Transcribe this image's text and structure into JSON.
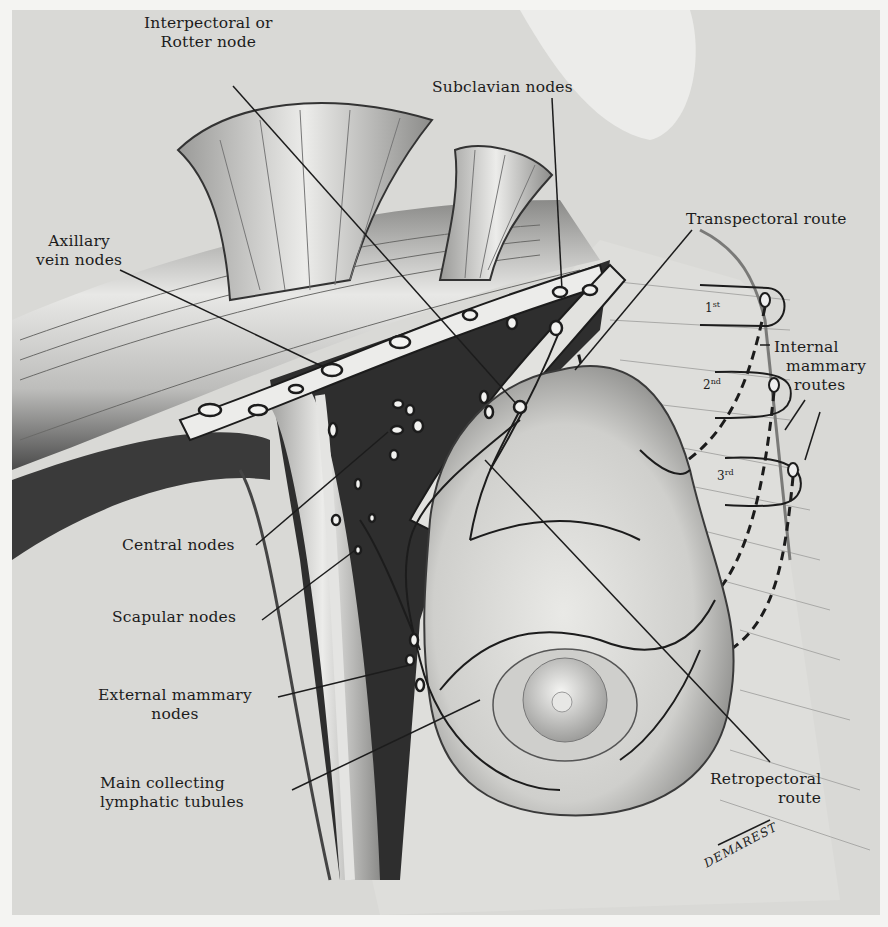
{
  "figure": {
    "artist_signature": "DEMAREST"
  },
  "labels": {
    "interpectoral": {
      "line1": "Interpectoral or",
      "line2": "Rotter node"
    },
    "subclavian": "Subclavian nodes",
    "axillary_vein": {
      "line1": "Axillary",
      "line2": "vein nodes"
    },
    "transpectoral": "Transpectoral route",
    "internal_mammary": {
      "line1": "Internal",
      "line2": "mammary",
      "line3": "routes"
    },
    "central": "Central nodes",
    "scapular": "Scapular nodes",
    "external_mammary": {
      "line1": "External mammary",
      "line2": "nodes"
    },
    "main_collecting": {
      "line1": "Main collecting",
      "line2": "lymphatic tubules"
    },
    "retropectoral": {
      "line1": "Retropectoral",
      "line2": "route"
    }
  },
  "ribs": [
    {
      "num": "1",
      "suffix": "st"
    },
    {
      "num": "2",
      "suffix": "nd"
    },
    {
      "num": "3",
      "suffix": "rd"
    }
  ],
  "colors": {
    "background": "#d9d9d6",
    "page": "#f4f4f2",
    "ink": "#1c1c1c",
    "muscle_dark": "#3a3a3a",
    "tissue_light": "#e6e6e3",
    "node_fill": "#f2f2f0"
  }
}
